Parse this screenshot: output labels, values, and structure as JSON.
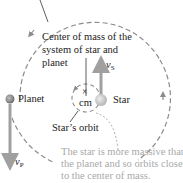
{
  "diagram": {
    "labels": {
      "center_of_mass_line1": "Center of mass of the",
      "center_of_mass_line2": "system of star and",
      "center_of_mass_line3": "planet",
      "cm": "cm",
      "cm_marker": "×",
      "star": "Star",
      "planet": "Planet",
      "star_orbit": "Star’s orbit",
      "v_star": "v",
      "v_star_sub": "S",
      "v_planet": "v",
      "v_planet_sub": "P"
    },
    "note": {
      "line1": "The star is more massive than",
      "line2": "the planet and so orbits closer",
      "line3": "to the center of mass."
    },
    "colors": {
      "orbit_dash": "#8c8c8c",
      "velocity_arrow": "#a0a0a0",
      "planet_body": "#8a8a8a",
      "star_body": "#c8c8c8",
      "text": "#222222",
      "note_text": "#a9a9a9"
    }
  }
}
